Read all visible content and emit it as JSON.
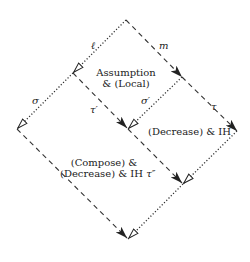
{
  "diagram": {
    "type": "commutation-diamond",
    "colors": {
      "line": "#333333",
      "text": "#222222",
      "background": "#ffffff"
    },
    "edge_labels": {
      "ell": "ℓ",
      "m": "m",
      "sigma": "σ",
      "tau_prime": "τ′",
      "sigma_prime": "σ′",
      "tau": "τ",
      "tau_double_prime": "τ″"
    },
    "region_labels": {
      "top_line1": "Assumption",
      "top_line2": "& (Local)",
      "right_text": "(Decrease) & IH",
      "bottom_line1": "(Compose) &",
      "bottom_line2": "(Decrease) & IH"
    },
    "edges": [
      {
        "from": "top",
        "to": "left1",
        "style": "dotted",
        "label": "ℓ",
        "arrow": "open"
      },
      {
        "from": "top",
        "to": "right1",
        "style": "dashed",
        "label": "m",
        "arrow": "filled"
      },
      {
        "from": "left1",
        "to": "left2",
        "style": "dotted",
        "label": "σ",
        "arrow": "open"
      },
      {
        "from": "left1",
        "to": "mid",
        "style": "dashed",
        "label": "τ′",
        "arrow": "filled"
      },
      {
        "from": "right1",
        "to": "mid",
        "style": "dotted",
        "label": "σ′",
        "arrow": "open"
      },
      {
        "from": "right1",
        "to": "right2",
        "style": "dashed",
        "label": "τ",
        "arrow": "filled"
      },
      {
        "from": "mid",
        "to": "lowright",
        "style": "dashed",
        "arrow": "filled"
      },
      {
        "from": "right2",
        "to": "lowright",
        "style": "dotted",
        "arrow": "open"
      },
      {
        "from": "left2",
        "to": "bottom",
        "style": "dashed",
        "label": "τ″",
        "arrow": "filled"
      },
      {
        "from": "lowright",
        "to": "bottom",
        "style": "dotted",
        "arrow": "open"
      }
    ]
  }
}
